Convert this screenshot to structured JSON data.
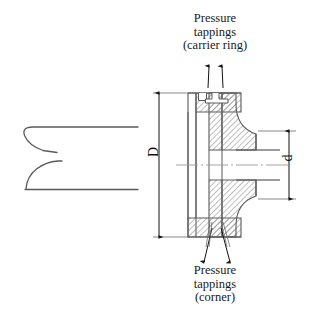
{
  "figure": {
    "type": "engineering-cross-section",
    "background_color": "#ffffff",
    "line_color": "#4a4a4a",
    "hatch_color": "#7a7a7a",
    "text_color": "#1a1a1a"
  },
  "labels": {
    "carrier_ring": "Pressure\ntappings\n(carrier ring)",
    "corner": "Pressure\ntappings\n(corner)"
  },
  "dimensions": {
    "pipe_diameter_symbol": "D",
    "throat_diameter_symbol": "d"
  },
  "annotations": {
    "leader_count_top": 2,
    "leader_count_bottom": 2,
    "centerline": "horizontal-axis-of-symmetry"
  }
}
